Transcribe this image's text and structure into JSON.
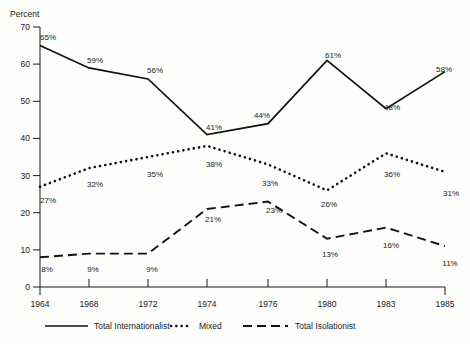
{
  "chart_data": {
    "type": "line",
    "title": "",
    "subtitle": "",
    "xlabel": "",
    "ylabel": "Percent",
    "ylim": [
      0,
      70
    ],
    "ytick_values": [
      0,
      10,
      20,
      30,
      40,
      50,
      60,
      70
    ],
    "ytick_labels": [
      "0",
      "10",
      "20",
      "30",
      "40",
      "50",
      "60",
      "70"
    ],
    "categories": [
      "1964",
      "1968",
      "1972",
      "1974",
      "1976",
      "1980",
      "1983",
      "1985"
    ],
    "x": [
      1964,
      1968,
      1972,
      1974,
      1976,
      1980,
      1983,
      1985
    ],
    "grid": false,
    "legend_position": "bottom",
    "value_suffix": "%",
    "series": [
      {
        "name": "Total Internationalist",
        "style": "solid",
        "values": [
          65,
          59,
          56,
          41,
          44,
          61,
          48,
          58
        ],
        "labels": [
          "65%",
          "59%",
          "56%",
          "41%",
          "44%",
          "61%",
          "48%",
          "58%"
        ]
      },
      {
        "name": "Mixed",
        "style": "dotted",
        "values": [
          27,
          32,
          35,
          38,
          33,
          26,
          36,
          31
        ],
        "labels": [
          "27%",
          "32%",
          "35%",
          "38%",
          "33%",
          "26%",
          "36%",
          "31%"
        ]
      },
      {
        "name": "Total Isolationist",
        "style": "dashed",
        "values": [
          8,
          9,
          9,
          21,
          23,
          13,
          16,
          11
        ],
        "labels": [
          "8%",
          "9%",
          "9%",
          "21%",
          "23%",
          "13%",
          "16%",
          "11%"
        ]
      }
    ],
    "legend": [
      {
        "label": "Total Internationalist",
        "style": "solid"
      },
      {
        "label": "Mixed",
        "style": "dotted"
      },
      {
        "label": "Total Isolationist",
        "style": "dashed"
      }
    ],
    "colors": {
      "ink": "#111111",
      "background": "#fdfdfc"
    }
  }
}
